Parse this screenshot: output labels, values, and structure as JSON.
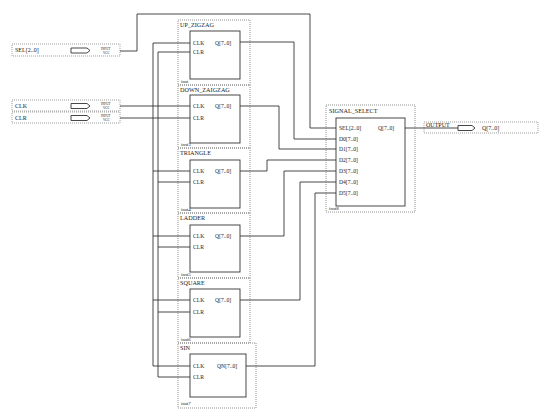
{
  "diagram": {
    "type": "block-schematic",
    "inputs": [
      {
        "name": "SEL[2..0]",
        "tag": "INPUT",
        "tag2": "VCC"
      },
      {
        "name": "CLK",
        "tag": "INPUT",
        "tag2": "VCC"
      },
      {
        "name": "CLR",
        "tag": "INPUT",
        "tag2": "VCC"
      }
    ],
    "output": {
      "tag": "OUTPUT",
      "name": "Q[7..0]"
    },
    "blocks": [
      {
        "title": "UP_ZIGZAG",
        "inst": "inst",
        "pins_in": [
          "CLK",
          "CLR"
        ],
        "pin_out": "Q[7..0]"
      },
      {
        "title": "DOWN_ZAIGZAG",
        "inst": "inst3",
        "pins_in": [
          "CLK",
          "CLR"
        ],
        "pin_out": "Q[7..0]"
      },
      {
        "title": "TRIANGLE",
        "inst": "inst4",
        "pins_in": [
          "CLK",
          "CLR"
        ],
        "pin_out": "Q[7..0]"
      },
      {
        "title": "LADDER",
        "inst": "inst5",
        "pins_in": [
          "CLK",
          "CLR"
        ],
        "pin_out": "Q[7..0]"
      },
      {
        "title": "SQUARE",
        "inst": "inst6",
        "pins_in": [
          "CLK",
          "CLR"
        ],
        "pin_out": "Q[7..0]"
      },
      {
        "title": "SIN",
        "inst": "inst7",
        "pins_in": [
          "CLK",
          "CLR"
        ],
        "pin_out": "QN[7..0]"
      }
    ],
    "selector": {
      "title": "SIGNAL_SELECT",
      "inst": "inst8",
      "pins_in": [
        "SEL[2..0]",
        "D0[7..0]",
        "D1[7..0]",
        "D2[7..0]",
        "D3[7..0]",
        "D4[7..0]",
        "D5[7..0]"
      ],
      "pin_out": "Q[7..0]"
    }
  }
}
